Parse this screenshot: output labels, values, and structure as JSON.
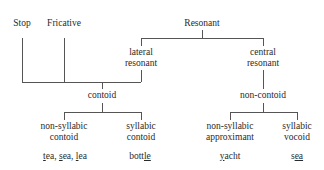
{
  "diagram": {
    "nodes": {
      "stop": "Stop",
      "fricative": "Fricative",
      "resonant": "Resonant",
      "lateral_resonant": [
        "lateral",
        "resonant"
      ],
      "central_resonant": [
        "central",
        "resonant"
      ],
      "contoid": "contoid",
      "non_contoid": "non-contoid",
      "non_syllabic_contoid": [
        "non-syllabic",
        "contoid"
      ],
      "syllabic_contoid": [
        "syllabic",
        "contoid"
      ],
      "non_syllabic_approximant": [
        "non-syllabic",
        "approximant"
      ],
      "syllabic_vocoid": [
        "syllabic",
        "vocoid"
      ]
    },
    "examples": {
      "non_syllabic_contoid": [
        {
          "underlined": "t",
          "rest": "ea"
        },
        {
          "sep": ", "
        },
        {
          "underlined": "s",
          "rest": "ea"
        },
        {
          "sep": ", "
        },
        {
          "underlined": "l",
          "rest": "ea"
        }
      ],
      "syllabic_contoid": {
        "pre": "bott",
        "underlined": "le",
        "post": ""
      },
      "non_syllabic_approximant": {
        "pre": "",
        "underlined": "y",
        "post": "acht"
      },
      "syllabic_vocoid": {
        "pre": "s",
        "underlined": "ea",
        "post": ""
      }
    },
    "colors": {
      "line": "#555555",
      "text": "#2a2a2a",
      "background": "#ffffff"
    }
  }
}
